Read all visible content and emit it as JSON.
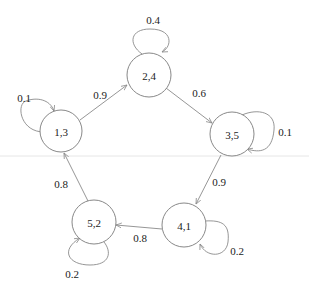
{
  "diagram": {
    "type": "markov-chain",
    "nodes": [
      {
        "id": "n13",
        "label": "1,3",
        "x": 61,
        "y": 131
      },
      {
        "id": "n24",
        "label": "2,4",
        "x": 149,
        "y": 75
      },
      {
        "id": "n35",
        "label": "3,5",
        "x": 232,
        "y": 134
      },
      {
        "id": "n41",
        "label": "4,1",
        "x": 184,
        "y": 225
      },
      {
        "id": "n52",
        "label": "5,2",
        "x": 94,
        "y": 222
      }
    ],
    "edges": [
      {
        "from": "1,3",
        "to": "2,4",
        "label": "0.9"
      },
      {
        "from": "2,4",
        "to": "3,5",
        "label": "0.6"
      },
      {
        "from": "3,5",
        "to": "4,1",
        "label": "0.9"
      },
      {
        "from": "4,1",
        "to": "5,2",
        "label": "0.8"
      },
      {
        "from": "5,2",
        "to": "1,3",
        "label": "0.8"
      },
      {
        "from": "1,3",
        "to": "1,3",
        "label": "0.1"
      },
      {
        "from": "2,4",
        "to": "2,4",
        "label": "0.4"
      },
      {
        "from": "3,5",
        "to": "3,5",
        "label": "0.1"
      },
      {
        "from": "4,1",
        "to": "4,1",
        "label": "0.2"
      },
      {
        "from": "5,2",
        "to": "5,2",
        "label": "0.2"
      }
    ],
    "colors": {
      "stroke": "#8a8a8a",
      "text": "#222222",
      "background": "#ffffff"
    }
  }
}
